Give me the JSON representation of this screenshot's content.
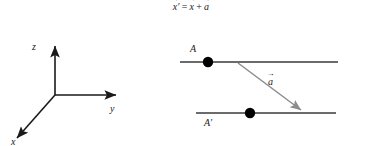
{
  "figure": {
    "width": 382,
    "height": 146,
    "background": "#ffffff",
    "equation": {
      "lhs_symbol": "x",
      "lhs_prime": "′",
      "equals": "=",
      "rhs_symbol_1": "x",
      "plus": "+",
      "rhs_symbol_2": "a",
      "vector_mark": "→",
      "plain_text": "x′ = x + a"
    },
    "axes": {
      "origin": {
        "x": 55,
        "y": 95
      },
      "items": [
        {
          "name": "z",
          "label": "z",
          "direction": "up",
          "tip": {
            "x": 55,
            "y": 44
          }
        },
        {
          "name": "y",
          "label": "y",
          "direction": "right",
          "tip": {
            "x": 118,
            "y": 95
          }
        },
        {
          "name": "x",
          "label": "x",
          "direction": "lower-left",
          "tip": {
            "x": 14,
            "y": 140
          }
        }
      ],
      "color": "#1a1a1a"
    },
    "planes": [
      {
        "name": "upper-line",
        "label": "A",
        "y": 62,
        "x_start": 180,
        "x_end": 338,
        "dot_x": 208,
        "color": "#3a3a3a"
      },
      {
        "name": "lower-line",
        "label": "A′",
        "y": 113,
        "x_start": 196,
        "x_end": 336,
        "dot_x": 250,
        "color": "#3a3a3a"
      }
    ],
    "translation_vector": {
      "label": "a",
      "vector_mark": "→",
      "from": {
        "x": 238,
        "y": 63
      },
      "to": {
        "x": 303,
        "y": 112
      },
      "color": "#8c8c8c"
    },
    "dot_color": "#000000"
  }
}
